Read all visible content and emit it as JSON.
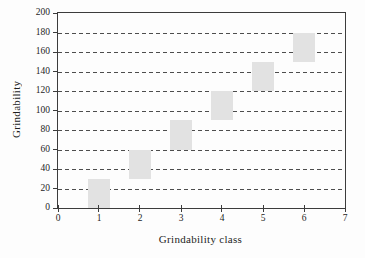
{
  "figure": {
    "background_color": "#fdfdfd",
    "text_color": "#1e1e1e",
    "axis_color": "#3c3c3c",
    "gridline_color": "#4d4d4d"
  },
  "chart_data": {
    "type": "bar",
    "subtype": "floating-column-ranges",
    "title": "",
    "xlabel": "Grindability class",
    "ylabel": "Grindability",
    "xlim": [
      0,
      7
    ],
    "ylim": [
      0,
      200
    ],
    "x_ticks": [
      0,
      1,
      2,
      3,
      4,
      5,
      6,
      7
    ],
    "y_ticks": [
      0,
      20,
      40,
      60,
      80,
      100,
      120,
      140,
      160,
      180,
      200
    ],
    "grid": "horizontal dashed lines at every y tick between 20 and 180",
    "legend": "none",
    "bar_fill": "#e2e2e2",
    "bar_width_units": 0.56,
    "series": [
      {
        "name": "Grindability range",
        "points": [
          {
            "x": 1,
            "low": 0,
            "high": 30
          },
          {
            "x": 2,
            "low": 30,
            "high": 60
          },
          {
            "x": 3,
            "low": 60,
            "high": 90
          },
          {
            "x": 4,
            "low": 90,
            "high": 120
          },
          {
            "x": 5,
            "low": 120,
            "high": 150
          },
          {
            "x": 6,
            "low": 150,
            "high": 180
          }
        ]
      }
    ]
  }
}
